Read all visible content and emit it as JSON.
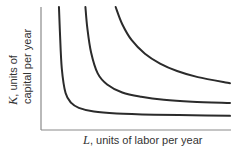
{
  "chart_data": {
    "type": "line",
    "title": "",
    "xlabel": {
      "var": "L",
      "text": ", units of labor per year"
    },
    "ylabel": {
      "var": "K",
      "line1": ", units of",
      "line2": "capital per year"
    },
    "xlim": [
      0,
      10
    ],
    "ylim": [
      0,
      10
    ],
    "grid": false,
    "ticks": false,
    "legend": "none",
    "series": [
      {
        "name": "isoquant-1",
        "x": [
          0.95,
          1.0,
          1.1,
          1.3,
          1.6,
          2.0,
          2.8,
          4.0,
          6.0,
          8.0,
          10.0
        ],
        "y": [
          10.0,
          8.0,
          5.0,
          3.0,
          2.2,
          1.8,
          1.5,
          1.35,
          1.25,
          1.2,
          1.15
        ]
      },
      {
        "name": "isoquant-2",
        "x": [
          2.35,
          2.45,
          2.65,
          3.0,
          3.5,
          4.3,
          5.3,
          6.5,
          8.0,
          10.0
        ],
        "y": [
          10.0,
          8.3,
          6.3,
          4.6,
          3.7,
          3.05,
          2.7,
          2.45,
          2.3,
          2.2
        ]
      },
      {
        "name": "isoquant-3",
        "x": [
          3.95,
          4.3,
          4.8,
          5.5,
          6.3,
          7.2,
          8.3,
          10.0
        ],
        "y": [
          10.0,
          8.6,
          7.3,
          6.2,
          5.4,
          4.8,
          4.3,
          3.8
        ]
      }
    ]
  }
}
